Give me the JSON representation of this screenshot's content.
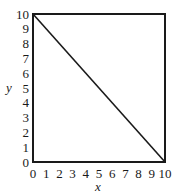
{
  "chart_data": {
    "type": "line",
    "title": "",
    "xlabel": "x",
    "ylabel": "y",
    "xlim": [
      0,
      10
    ],
    "ylim": [
      0,
      10
    ],
    "xticks": [
      0,
      1,
      2,
      3,
      4,
      5,
      6,
      7,
      8,
      9,
      10
    ],
    "yticks": [
      0,
      1,
      2,
      3,
      4,
      5,
      6,
      7,
      8,
      9,
      10
    ],
    "grid": false,
    "legend": null,
    "series": [
      {
        "name": "line",
        "x": [
          0,
          10
        ],
        "y": [
          10,
          0
        ]
      }
    ],
    "colors": {
      "line": "#1a1a1a",
      "frame": "#1a1a1a"
    }
  }
}
